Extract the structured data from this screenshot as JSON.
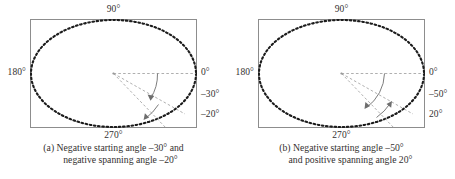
{
  "figure": {
    "panels": [
      {
        "id": "a",
        "axis_labels": {
          "top": "90°",
          "left": "180°",
          "bottom": "270°",
          "right_0": "0°",
          "right_1": "–30°",
          "right_2": "–20°"
        },
        "caption_line1": "(a) Negative starting angle –30° and",
        "caption_line2": "negative spanning angle –20°",
        "start_angle_deg": -30,
        "span_angle_deg": -20,
        "ray_angles_deg": [
          0,
          -30,
          -50
        ],
        "arrow1_tip_deg": -30,
        "arrow2_tip_deg": -50
      },
      {
        "id": "b",
        "axis_labels": {
          "top": "90°",
          "left": "180°",
          "bottom": "270°",
          "right_0": "0°",
          "right_1": "–50°",
          "right_2": "20°"
        },
        "caption_line1": "(b) Negative starting angle –50°",
        "caption_line2": "and positive spanning angle 20°",
        "start_angle_deg": -50,
        "span_angle_deg": 20,
        "ray_angles_deg": [
          0,
          -50,
          -30
        ],
        "arrow1_tip_deg": -50,
        "arrow2_tip_deg": -30
      }
    ],
    "colors": {
      "frame": "#8d8d8d",
      "ellipse": "#1c1c1c",
      "guide": "#9a9a9a",
      "arrow": "#6e6e6e",
      "text": "#33302f"
    },
    "ellipse": {
      "center_x": 83.5,
      "center_y": 54.5,
      "radius_x": 83.5,
      "radius_y": 54.5,
      "dash": "dotted"
    }
  }
}
